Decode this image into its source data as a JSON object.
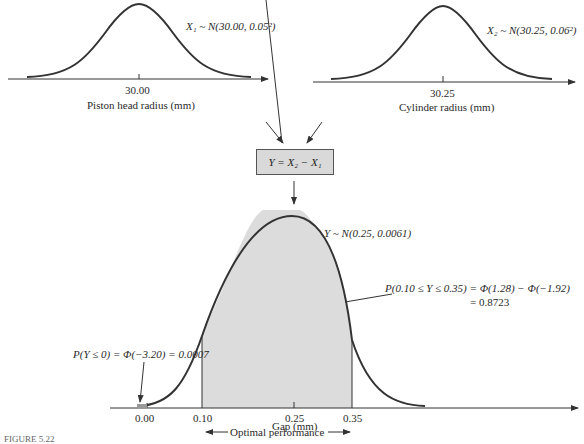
{
  "top_left": {
    "dist_label": "X₁ ~ N(30.00, 0.05²)",
    "tick": "30.00",
    "axis_label": "Piston head radius (mm)"
  },
  "top_right": {
    "dist_label": "X₂ ~ N(30.25, 0.06²)",
    "tick": "30.25",
    "axis_label": "Cylinder radius (mm)"
  },
  "combine_box": "Y = X₂ − X₁",
  "bottom": {
    "dist_label": "Y ~ N(0.25, 0.0061)",
    "prob_mid_line1": "P(0.10 ≤ Y ≤ 0.35) = Φ(1.28) − Φ(−1.92)",
    "prob_mid_line2": "= 0.8723",
    "prob_low": "P(Y ≤ 0) = Φ(−3.20) = 0.0007",
    "ticks": [
      "0.00",
      "0.10",
      "0.25",
      "0.35"
    ],
    "axis_label": "Gap (mm)",
    "range_label": "Optimal performance"
  },
  "caption": "FIGURE 5.22",
  "colors": {
    "curve": "#333333",
    "shade": "#dcdcdc",
    "box": "#d9d9d9"
  }
}
